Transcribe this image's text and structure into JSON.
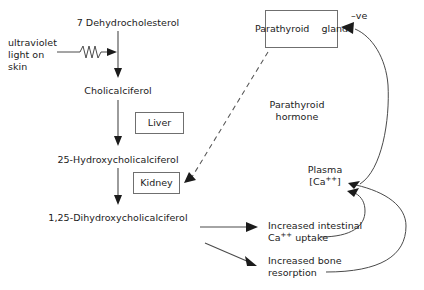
{
  "diagram": {
    "nodes": {
      "dehydrocholesterol": "7 Dehydrocholesterol",
      "uv_line1": "ultraviolet",
      "uv_line2": "light on",
      "uv_line3": "skin",
      "cholicalciferol": "Cholicalciferol",
      "liver": "Liver",
      "hydroxy": "25-Hydroxycholicalciferol",
      "kidney": "Kidney",
      "dihydroxy": "1,25-Dihydroxycholicalciferol",
      "parathyroid_gland_line1": "Parathyroid",
      "parathyroid_gland_line2": "gland",
      "parathyroid_hormone_line1": "Parathyroid",
      "parathyroid_hormone_line2": "hormone",
      "negative_feedback": "–ve",
      "plasma_line1": "Plasma",
      "plasma_line2_pre": "[Ca",
      "plasma_line2_sup": "++",
      "plasma_line2_post": "]",
      "intestinal_line1": "Increased intestinal",
      "intestinal_line2_pre": "Ca",
      "intestinal_line2_sup": "++",
      "intestinal_line2_post": " uptake",
      "bone_line1": "Increased bone",
      "bone_line2": "resorption"
    },
    "colors": {
      "stroke": "#4a4a4a",
      "text": "#1b1b1b",
      "box_border": "#6f6f6f",
      "background": "#ffffff"
    }
  }
}
